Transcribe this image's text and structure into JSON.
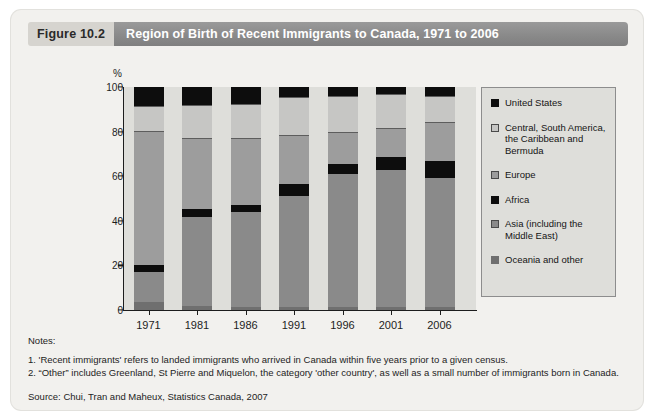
{
  "figure": {
    "tag": "Figure 10.2",
    "title": "Region of Birth of Recent Immigrants to Canada, 1971 to 2006"
  },
  "notes": {
    "heading": "Notes:",
    "items": [
      "1. 'Recent immigrants' refers to landed immigrants who arrived in Canada within five years prior to a given census.",
      "2. “Other” includes Greenland, St Pierre and Miquelon, the category 'other country', as well as a small number of immigrants born in Canada."
    ],
    "source": "Source: Chui, Tran and Maheux, Statistics Canada, 2007"
  },
  "colors": {
    "header_tag_bg": "#d6d4cf",
    "header_title_bg": "#8b8b8b",
    "card_bg": "#f2f1ee",
    "plot_bg": "#dededa",
    "united_states": "#0d0d0d",
    "central_south_america": "#c6c6c4",
    "europe": "#9d9d9d",
    "africa": "#0d0d0d",
    "asia": "#8a8a8a",
    "oceania_and_other": "#6f6f6f"
  },
  "chart_data": {
    "type": "bar",
    "subtype": "stacked-percentage",
    "title": "Region of Birth of Recent Immigrants to Canada, 1971 to 2006",
    "xlabel": "",
    "ylabel": "%",
    "ylim": [
      0,
      100
    ],
    "yticks": [
      0,
      20,
      40,
      60,
      80,
      100
    ],
    "grid": false,
    "legend_position": "right",
    "categories": [
      "1971",
      "1981",
      "1986",
      "1991",
      "1996",
      "2001",
      "2006"
    ],
    "stack_order_bottom_to_top": [
      "Oceania and other",
      "Asia (including the Middle East)",
      "Africa",
      "Europe",
      "Central, South America, the Caribbean and Bermuda",
      "United States"
    ],
    "series": [
      {
        "name": "Oceania and other",
        "values": [
          3.5,
          2.0,
          1.5,
          1.5,
          1.5,
          1.5,
          1.5
        ]
      },
      {
        "name": "Asia (including the Middle East)",
        "values": [
          13.5,
          39.5,
          42.5,
          49.5,
          59.5,
          61.5,
          57.5
        ]
      },
      {
        "name": "Africa",
        "values": [
          3.0,
          4.0,
          3.0,
          5.5,
          4.5,
          5.5,
          8.0
        ]
      },
      {
        "name": "Europe",
        "values": [
          60.5,
          31.5,
          30.0,
          22.0,
          14.5,
          13.0,
          17.5
        ]
      },
      {
        "name": "Central, South America, the Caribbean and Bermuda",
        "values": [
          11.0,
          15.0,
          15.5,
          17.0,
          16.0,
          15.5,
          11.5
        ]
      },
      {
        "name": "United States",
        "values": [
          8.5,
          8.0,
          7.5,
          4.5,
          4.0,
          3.0,
          4.0
        ]
      }
    ],
    "legend_entries": [
      {
        "label": "United States",
        "swatch": "#0d0d0d"
      },
      {
        "label": "Central, South America, the Caribbean and Bermuda",
        "swatch": "#c6c6c4"
      },
      {
        "label": "Europe",
        "swatch": "#9d9d9d"
      },
      {
        "label": "Africa",
        "swatch": "#0d0d0d"
      },
      {
        "label": "Asia (including the Middle East)",
        "swatch": "#8a8a8a"
      },
      {
        "label": "Oceania and other",
        "swatch": "#6f6f6f"
      }
    ],
    "legend_display_lines": [
      [
        "United States"
      ],
      [
        "Central, South America,",
        "the Caribbean and",
        "Bermuda"
      ],
      [
        "Europe"
      ],
      [
        "Africa"
      ],
      [
        "Asia (including the",
        "Middle East)"
      ],
      [
        "Oceania and other"
      ]
    ]
  }
}
